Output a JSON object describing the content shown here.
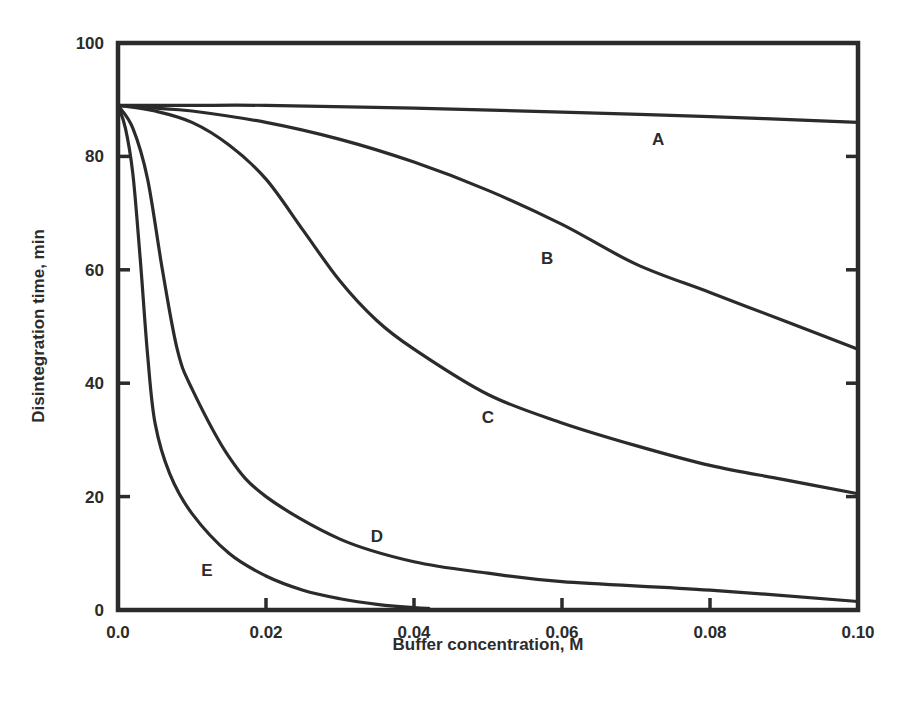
{
  "chart_data": {
    "type": "line",
    "title": "",
    "xlabel": "Buffer concentration, M",
    "ylabel": "Disintegration time, min",
    "xlim": [
      0.0,
      0.1
    ],
    "ylim": [
      0,
      100
    ],
    "grid": false,
    "legend": "inline curve labels",
    "x_ticks": [
      "0.0",
      "0.02",
      "0.04",
      "0.06",
      "0.08",
      "0.10"
    ],
    "y_ticks": [
      "0",
      "20",
      "40",
      "60",
      "80",
      "100"
    ],
    "series": [
      {
        "name": "A",
        "label_pos": [
          0.073,
          83
        ],
        "x": [
          0.0,
          0.01,
          0.02,
          0.04,
          0.06,
          0.08,
          0.1
        ],
        "y": [
          89,
          89,
          89,
          88.5,
          87.8,
          87,
          86
        ]
      },
      {
        "name": "B",
        "label_pos": [
          0.058,
          62
        ],
        "x": [
          0.0,
          0.005,
          0.01,
          0.02,
          0.03,
          0.04,
          0.05,
          0.06,
          0.07,
          0.08,
          0.09,
          0.1
        ],
        "y": [
          89,
          88.5,
          88,
          86,
          83,
          79,
          74,
          68,
          61,
          56,
          51,
          46
        ]
      },
      {
        "name": "C",
        "label_pos": [
          0.05,
          34
        ],
        "x": [
          0.0,
          0.005,
          0.01,
          0.015,
          0.02,
          0.025,
          0.03,
          0.035,
          0.04,
          0.05,
          0.06,
          0.07,
          0.08,
          0.09,
          0.1
        ],
        "y": [
          89,
          88,
          86,
          82,
          76,
          67,
          58,
          51,
          46,
          38,
          33,
          29,
          25.5,
          23,
          20.5
        ]
      },
      {
        "name": "D",
        "label_pos": [
          0.035,
          13
        ],
        "x": [
          0.0,
          0.002,
          0.004,
          0.006,
          0.008,
          0.01,
          0.015,
          0.02,
          0.03,
          0.04,
          0.05,
          0.06,
          0.08,
          0.1
        ],
        "y": [
          89,
          85,
          76,
          60,
          46,
          39,
          27,
          20,
          12.5,
          8.5,
          6.5,
          5,
          3.5,
          1.5
        ]
      },
      {
        "name": "E",
        "label_pos": [
          0.012,
          7
        ],
        "x": [
          0.0,
          0.001,
          0.002,
          0.003,
          0.004,
          0.005,
          0.007,
          0.01,
          0.015,
          0.02,
          0.025,
          0.03,
          0.035,
          0.04,
          0.042
        ],
        "y": [
          89,
          85,
          77,
          62,
          45,
          33,
          24,
          17,
          10,
          6,
          3.5,
          2,
          1,
          0.4,
          0.3
        ]
      }
    ]
  },
  "layout": {
    "plot_left": 118,
    "plot_right": 858,
    "plot_top": 43,
    "plot_bottom": 610,
    "ink_color": "#2b2b2b",
    "background": "#ffffff"
  }
}
